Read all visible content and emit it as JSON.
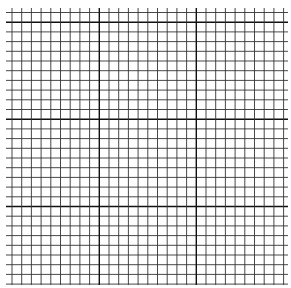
{
  "canvas": {
    "width": 291,
    "height": 288,
    "background": "#ffffff"
  },
  "grid": {
    "cell_size": 9.7,
    "h_line_start_y": 12.5,
    "h_line_count": 29,
    "h_line_x_range": [
      6,
      288
    ],
    "v_line_start_x": 12,
    "v_line_count": 29,
    "v_line_y_range": [
      8,
      285
    ],
    "minor_line_color": "#333333",
    "minor_line_width": 0.9,
    "major_line_color": "#111111",
    "major_line_width": 1.4,
    "major_h_indices": [
      1,
      11,
      20
    ],
    "major_v_indices": [
      9,
      19
    ]
  }
}
